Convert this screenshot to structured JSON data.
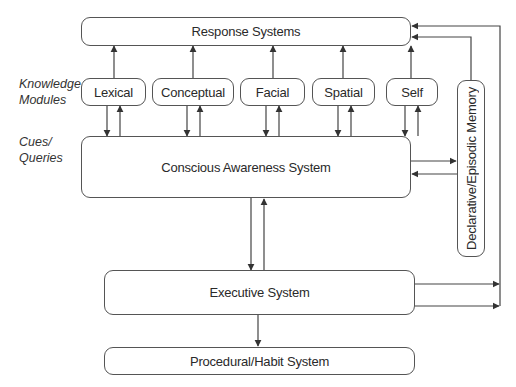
{
  "diagram": {
    "side_labels": {
      "knowledge_modules": [
        "Knowledge",
        "Modules"
      ],
      "cues_queries": [
        "Cues/",
        "Queries"
      ]
    },
    "nodes": {
      "response_systems": "Response Systems",
      "modules": [
        "Lexical",
        "Conceptual",
        "Facial",
        "Spatial",
        "Self"
      ],
      "declarative_memory": "Declarative/Episodic Memory",
      "conscious_awareness": "Conscious Awareness System",
      "executive": "Executive System",
      "procedural": "Procedural/Habit System"
    },
    "edges": [
      {
        "from": "Lexical",
        "to": "Response Systems"
      },
      {
        "from": "Conceptual",
        "to": "Response Systems"
      },
      {
        "from": "Facial",
        "to": "Response Systems"
      },
      {
        "from": "Spatial",
        "to": "Response Systems"
      },
      {
        "from": "Self",
        "to": "Response Systems"
      },
      {
        "from": "Lexical",
        "to": "Conscious Awareness System",
        "bidirectional": true
      },
      {
        "from": "Conceptual",
        "to": "Conscious Awareness System",
        "bidirectional": true
      },
      {
        "from": "Facial",
        "to": "Conscious Awareness System",
        "bidirectional": true
      },
      {
        "from": "Spatial",
        "to": "Conscious Awareness System",
        "bidirectional": true
      },
      {
        "from": "Self",
        "to": "Conscious Awareness System",
        "bidirectional": true
      },
      {
        "from": "Declarative/Episodic Memory",
        "to": "Response Systems"
      },
      {
        "from": "Conscious Awareness System",
        "to": "Declarative/Episodic Memory",
        "bidirectional": true
      },
      {
        "from": "Conscious Awareness System",
        "to": "Executive System",
        "bidirectional": true
      },
      {
        "from": "Executive System",
        "to": "Response Systems"
      },
      {
        "from": "Executive System",
        "to": "Procedural/Habit System"
      }
    ]
  }
}
